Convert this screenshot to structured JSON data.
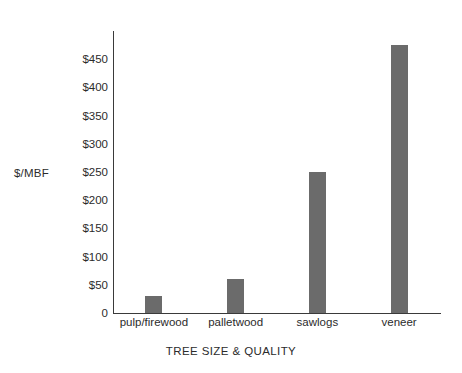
{
  "chart_data": {
    "type": "bar",
    "title": "",
    "subtitle": "",
    "xlabel": "TREE SIZE & QUALITY",
    "ylabel": "$/MBF",
    "categories": [
      "pulp/firewood",
      "palletwood",
      "sawlogs",
      "veneer"
    ],
    "values": [
      30,
      60,
      250,
      475
    ],
    "series": [
      {
        "name": "$/MBF",
        "values": [
          30,
          60,
          250,
          475
        ]
      }
    ],
    "ylim": [
      0,
      500
    ],
    "ytick_values": [
      0,
      50,
      100,
      150,
      200,
      250,
      300,
      350,
      400,
      450
    ],
    "ytick_labels": [
      "0",
      "$50",
      "$100",
      "$150",
      "$200",
      "$250",
      "$300",
      "$350",
      "$400",
      "$450"
    ],
    "grid": false,
    "legend": false,
    "legend_position": "none",
    "bar_color": "#6b6b6b",
    "axis_color": "#3a3a3a",
    "text_color": "#2b2b2b",
    "background_color": "#ffffff",
    "annotations": []
  }
}
